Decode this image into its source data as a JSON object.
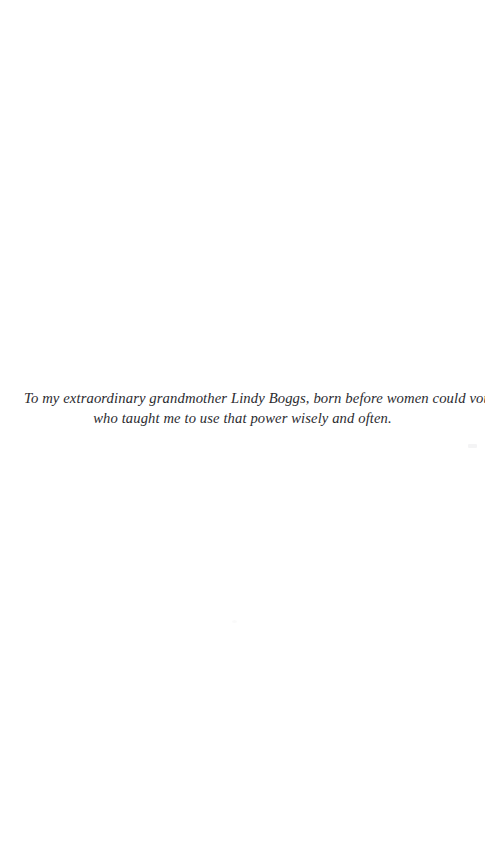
{
  "page": {
    "type": "book-dedication-page",
    "background_color": "#ffffff",
    "text_color": "#2b2b2f"
  },
  "dedication": {
    "full_text": "To my extraordinary grandmother Lindy Boggs, born before women could vote, who taught me to use that power wisely and often.",
    "lines": [
      "To my extraordinary grandmother Lindy Boggs, born before women could vote,",
      "who taught me to use that power wisely and often."
    ]
  }
}
